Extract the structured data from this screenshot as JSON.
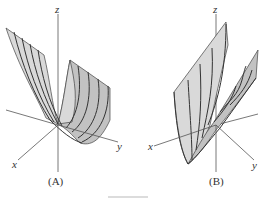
{
  "figures": [
    {
      "id": "A",
      "caption": "(A)",
      "axes": {
        "x": "x",
        "y": "y",
        "z": "z"
      },
      "description": "Parabolic cylinder surface opening upward, rulings parallel to y-axis direction"
    },
    {
      "id": "B",
      "caption": "(B)",
      "axes": {
        "x": "x",
        "y": "y",
        "z": "z"
      },
      "description": "Parabolic cylinder surface opening upward, rulings parallel to x-axis direction"
    }
  ],
  "colors": {
    "surface": "#d9d9d9",
    "surface_shadow": "#c2c2c2",
    "lines": "#333333",
    "axes": "#555555"
  }
}
